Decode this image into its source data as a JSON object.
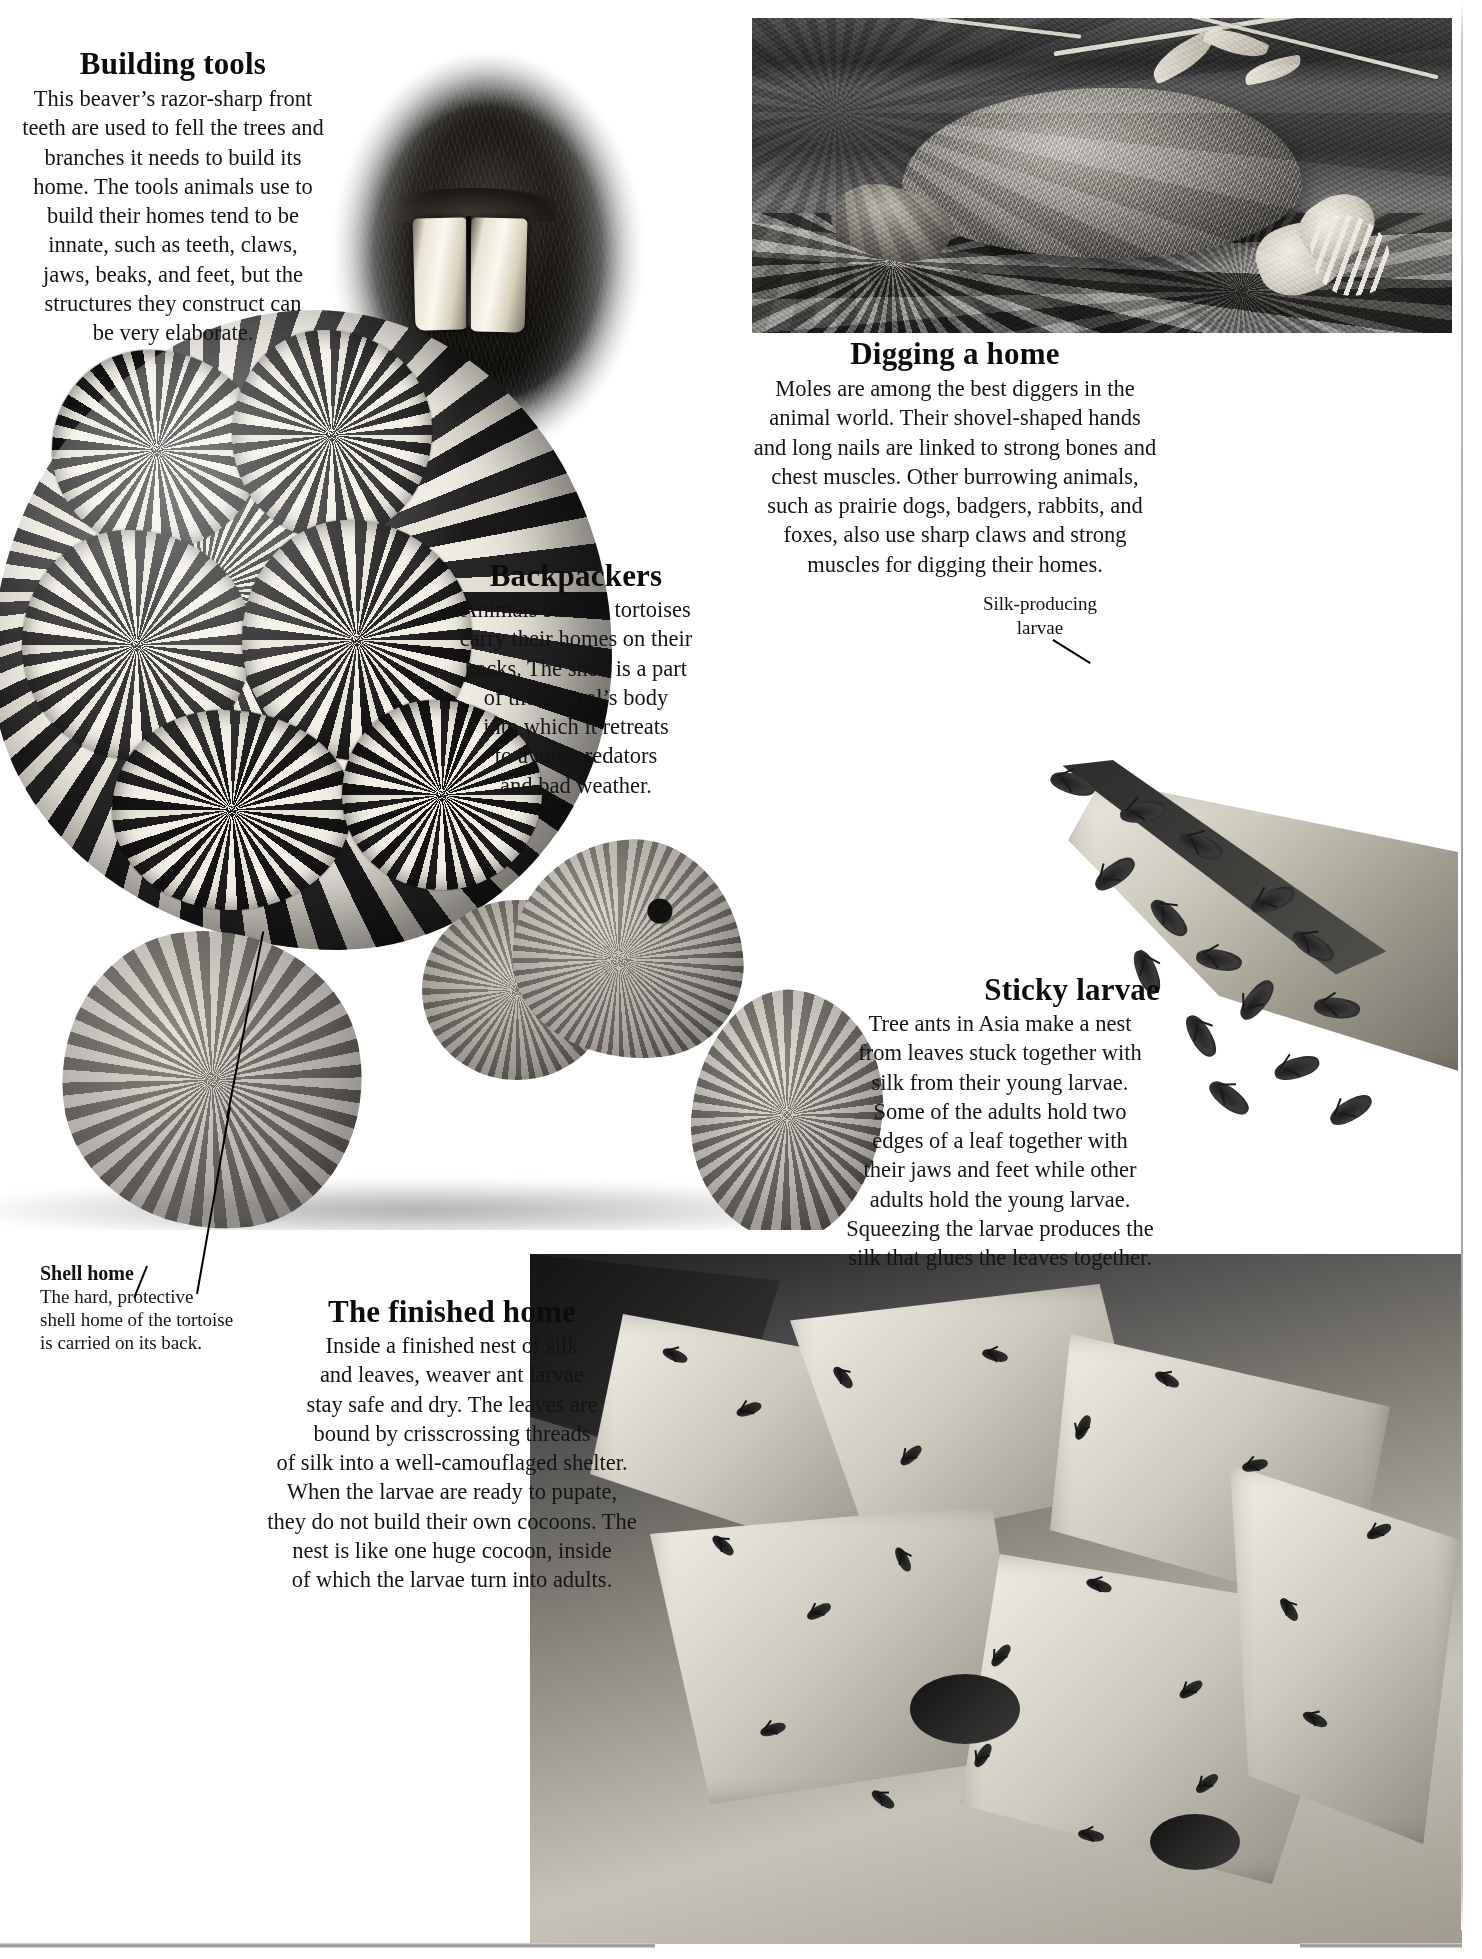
{
  "page": {
    "background_color": "#ffffff",
    "text_color": "#111111"
  },
  "sections": {
    "building_tools": {
      "heading": "Building tools",
      "lines": [
        "This beaver’s razor-sharp front",
        "teeth are used to fell the trees and",
        "branches it needs to build its",
        "home. The tools animals use to",
        "build their homes tend to be",
        "innate, such as teeth, claws,",
        "jaws, beaks, and feet, but the",
        "structures they construct can",
        "be very elaborate."
      ],
      "body": "This beaver’s razor-sharp front teeth are used to fell the trees and branches it needs to build its home. The tools animals use to build their homes tend to be innate, such as teeth, claws, jaws, beaks, and feet, but the structures they construct can be very elaborate."
    },
    "digging_a_home": {
      "heading": "Digging a home",
      "lines": [
        "Moles are among the best diggers in the",
        "animal world. Their shovel-shaped hands",
        "and long nails are linked to strong bones and",
        "chest muscles. Other burrowing animals,",
        "such as prairie dogs, badgers, rabbits, and",
        "foxes, also use sharp claws and strong",
        "muscles for digging their homes."
      ],
      "body": "Moles are among the best diggers in the animal world. Their shovel-shaped hands and long nails are linked to strong bones and chest muscles. Other burrowing animals, such as prairie dogs, badgers, rabbits, and foxes, also use sharp claws and strong muscles for digging their homes."
    },
    "backpackers": {
      "heading": "Backpackers",
      "lines": [
        "Animals such as tortoises",
        "carry their homes on their",
        "backs. The shell is a part",
        "of the animal’s body",
        "into which it retreats",
        "to avoid predators",
        "and bad weather."
      ],
      "body": "Animals such as tortoises carry their homes on their backs. The shell is a part of the animal’s body into which it retreats to avoid predators and bad weather."
    },
    "sticky_larvae": {
      "heading": "Sticky larvae",
      "lines": [
        "Tree ants in Asia make a nest",
        "from leaves stuck together with",
        "silk from their young larvae.",
        "Some of the adults hold two",
        "edges of a leaf together with",
        "their jaws and feet while other",
        "adults hold the young larvae.",
        "Squeezing the larvae produces the",
        "silk that glues the leaves together."
      ],
      "body": "Tree ants in Asia make a nest from leaves stuck together with silk from their young larvae. Some of the adults hold two edges of a leaf together with their jaws and feet while other adults hold the young larvae. Squeezing the larvae produces the silk that glues the leaves together."
    },
    "the_finished_home": {
      "heading": "The finished home",
      "lines": [
        "Inside a finished nest of silk",
        "and leaves, weaver ant larvae",
        "stay safe and dry. The leaves are",
        "bound by crisscrossing threads",
        "of silk into a well-camouflaged shelter.",
        "When the larvae are ready to pupate,",
        "they do not build their own cocoons. The",
        "nest is like one huge cocoon, inside",
        "of which the larvae turn into adults."
      ],
      "body": "Inside a finished nest of silk and leaves, weaver ant larvae stay safe and dry. The leaves are bound by crisscrossing threads of silk into a well-camouflaged shelter. When the larvae are ready to pupate, they do not build their own cocoons. The nest is like one huge cocoon, inside of which the larvae turn into adults."
    }
  },
  "captions": {
    "silk_producing_larvae": {
      "lines": [
        "Silk-producing",
        "larvae"
      ],
      "text": "Silk-producing larvae"
    },
    "shell_home": {
      "title": "Shell home",
      "lines": [
        "The hard, protective",
        "shell home of the tortoise",
        "is carried on its back."
      ],
      "text": "The hard, protective shell home of the tortoise is carried on its back."
    }
  },
  "photos": {
    "beaver_teeth": {
      "alt": "Close-up of a beaver’s razor-sharp orange front incisor teeth, oval vignette"
    },
    "mole": {
      "alt": "A mole on mossy ground showing its shovel-shaped hands and long claws"
    },
    "tortoise": {
      "alt": "A star-patterned tortoise walking, showing its hard protective shell"
    },
    "tree_ants": {
      "alt": "Weaver ants on the edge of a leaf holding silk-producing larvae"
    },
    "weaver_nest": {
      "alt": "A finished weaver ant nest of leaves bound with silk, covered in ants"
    }
  }
}
